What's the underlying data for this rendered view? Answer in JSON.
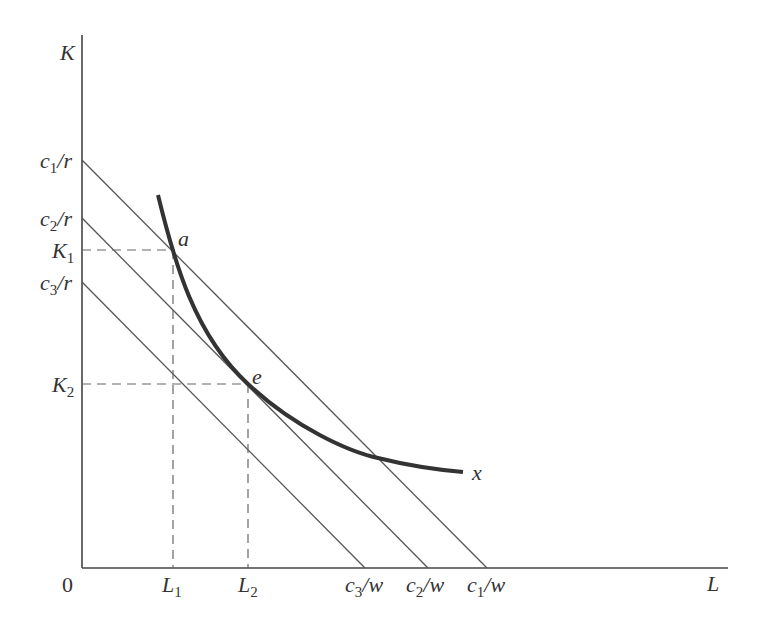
{
  "diagram": {
    "axes": {
      "y_label": "K",
      "x_label": "L",
      "origin_label": "0"
    },
    "isocost_lines": [
      {
        "name": "c1",
        "k_intercept_label": {
          "base": "c",
          "sub": "1",
          "rest": "/r"
        },
        "l_intercept_label": {
          "base": "c",
          "sub": "1",
          "rest": "/w"
        }
      },
      {
        "name": "c2",
        "k_intercept_label": {
          "base": "c",
          "sub": "2",
          "rest": "/r"
        },
        "l_intercept_label": {
          "base": "c",
          "sub": "2",
          "rest": "/w"
        }
      },
      {
        "name": "c3",
        "k_intercept_label": {
          "base": "c",
          "sub": "3",
          "rest": "/r"
        },
        "l_intercept_label": {
          "base": "c",
          "sub": "3",
          "rest": "/w"
        }
      }
    ],
    "isoquant": {
      "label": "x"
    },
    "points": [
      {
        "label": "a",
        "k_label": {
          "base": "K",
          "sub": "1"
        },
        "l_label": {
          "base": "L",
          "sub": "1"
        }
      },
      {
        "label": "e",
        "k_label": {
          "base": "K",
          "sub": "2"
        },
        "l_label": {
          "base": "L",
          "sub": "2"
        }
      }
    ],
    "colors": {
      "axis": "#444444",
      "line": "#555555",
      "curve": "#333333",
      "dashed": "#666666",
      "text": "#333333"
    }
  }
}
